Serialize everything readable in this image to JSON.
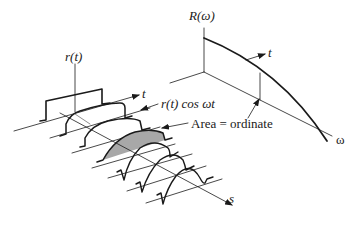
{
  "figure": {
    "colors": {
      "stroke": "#1a1a1a",
      "thin_stroke": "#3a3a3a",
      "shaded_area": "#a8a8a8",
      "background": "#ffffff"
    }
  },
  "left_panel": {
    "vertical_axis_label": "r(t)",
    "time_axis_label": "t",
    "product_label": "r(t) cos ωt",
    "area_annotation": "Area = ordinate",
    "slice_axis_label": "s",
    "slices": [
      {
        "index": 0,
        "shape": "rectangular pulse r(t)"
      },
      {
        "index": 1,
        "shape": "low-frequency cosine-weighted pulse"
      },
      {
        "index": 2,
        "shape": "cosine-weighted pulse"
      },
      {
        "index": 3,
        "shape": "shaded cosine-weighted pulse",
        "shaded": true
      },
      {
        "index": 4,
        "shape": "higher-frequency oscillation"
      },
      {
        "index": 5,
        "shape": "higher-frequency oscillation"
      },
      {
        "index": 6,
        "shape": "higher-frequency oscillation"
      }
    ]
  },
  "right_panel": {
    "vertical_axis_label": "R(ω)",
    "frequency_axis_label": "ω",
    "curve_pointer_label": "t"
  }
}
